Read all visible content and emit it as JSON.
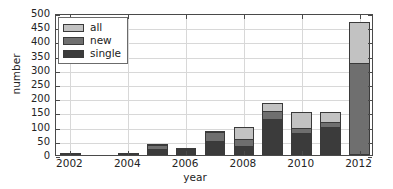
{
  "chart_data": {
    "type": "bar",
    "stacked": true,
    "title": "",
    "xlabel": "year",
    "ylabel": "number",
    "xlim": [
      2001.5,
      2012.5
    ],
    "ylim": [
      0,
      500
    ],
    "ytick_labels": [
      "0",
      "50",
      "100",
      "150",
      "200",
      "250",
      "300",
      "350",
      "400",
      "450",
      "500"
    ],
    "ytick_values": [
      0,
      50,
      100,
      150,
      200,
      250,
      300,
      350,
      400,
      450,
      500
    ],
    "xtick_labels": [
      "2002",
      "2004",
      "2006",
      "2008",
      "2010",
      "2012"
    ],
    "xtick_values": [
      2002,
      2004,
      2006,
      2008,
      2010,
      2012
    ],
    "categories": [
      2002,
      2003,
      2004,
      2005,
      2006,
      2007,
      2008,
      2009,
      2010,
      2011,
      2012
    ],
    "grid": true,
    "legend_position": "upper left",
    "series": [
      {
        "name": "single",
        "color": "#3b3b3b",
        "values": [
          1,
          0,
          2,
          20,
          20,
          50,
          33,
          127,
          78,
          97,
          0
        ]
      },
      {
        "name": "new",
        "color": "#6f6f6f",
        "values": [
          1,
          0,
          2,
          37,
          25,
          80,
          57,
          155,
          95,
          118,
          325
        ]
      },
      {
        "name": "all",
        "color": "#c2c2c2",
        "values": [
          1,
          0,
          2,
          40,
          25,
          83,
          98,
          182,
          153,
          153,
          468
        ]
      }
    ]
  },
  "legend": {
    "entries": [
      {
        "label": "all",
        "swatch": "swatch-all"
      },
      {
        "label": "new",
        "swatch": "swatch-new"
      },
      {
        "label": "single",
        "swatch": "swatch-single"
      }
    ]
  },
  "axes": {
    "x_title": "year",
    "y_title": "number"
  }
}
